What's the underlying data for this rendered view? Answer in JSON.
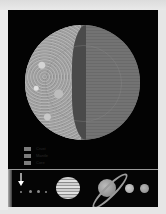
{
  "figure": {
    "colors": {
      "background": "#030303",
      "page": "#e6e6e6",
      "surface": "#a8a8a8",
      "mantle": "#4a4a4a",
      "core": "#6d6d6d",
      "legend_swatch": "#7c7c7c"
    }
  },
  "legend": {
    "items": [
      {
        "label": "Crust"
      },
      {
        "label": "Mantle"
      },
      {
        "label": "Core"
      }
    ]
  },
  "solar_system_strip": {
    "marker_icon": "arrow-down-icon",
    "planets": [
      "Mercury",
      "Venus",
      "Earth",
      "Mars",
      "Jupiter",
      "Saturn",
      "Uranus",
      "Neptune"
    ]
  }
}
